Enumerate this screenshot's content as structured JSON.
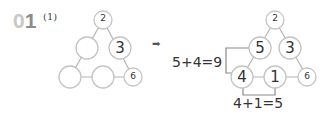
{
  "problem": {
    "number_prefix": "0",
    "number_suffix": "1",
    "sub_label": "(1)"
  },
  "colors": {
    "prefix_gray": "#c8c8c8",
    "suffix_gray": "#8c8c8c",
    "circle_stroke": "#c4c4c4",
    "line": "#b4b4b4",
    "text": "#333333"
  },
  "arrow": "➡",
  "left_triangle": {
    "nodes": [
      {
        "id": "top",
        "value": "2"
      },
      {
        "id": "mid-left",
        "value": ""
      },
      {
        "id": "mid-right",
        "value": "3"
      },
      {
        "id": "bottom-left",
        "value": ""
      },
      {
        "id": "bottom-mid",
        "value": ""
      },
      {
        "id": "bottom-right",
        "value": "6"
      }
    ]
  },
  "right_triangle": {
    "nodes": [
      {
        "id": "top",
        "value": "2"
      },
      {
        "id": "mid-left",
        "value": "5"
      },
      {
        "id": "mid-right",
        "value": "3"
      },
      {
        "id": "bottom-left",
        "value": "4"
      },
      {
        "id": "bottom-mid",
        "value": "1"
      },
      {
        "id": "bottom-right",
        "value": "6"
      }
    ]
  },
  "equations": {
    "left_side": "5+4=9",
    "bottom": "4+1=5"
  }
}
